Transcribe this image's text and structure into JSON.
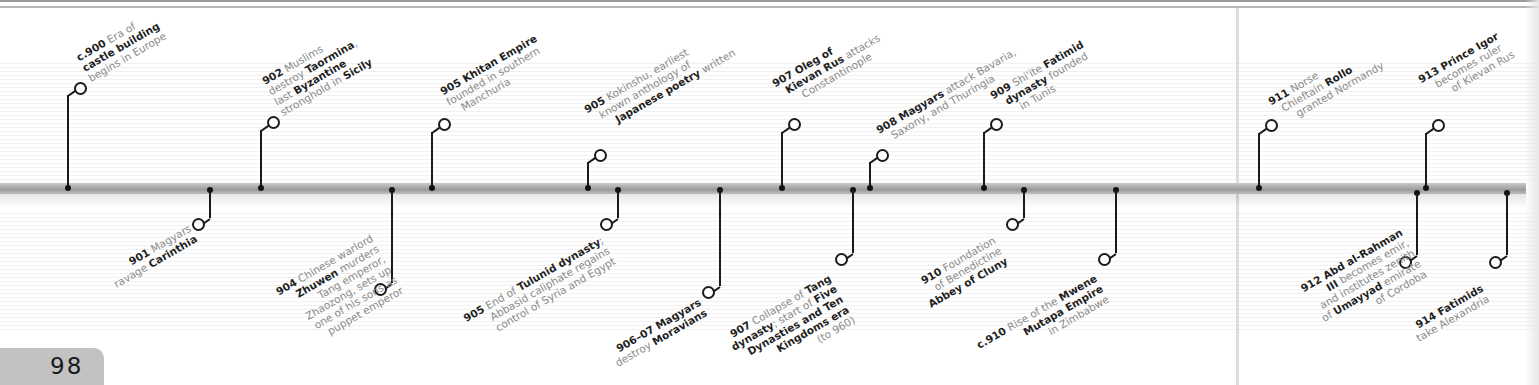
{
  "page": {
    "number": "98",
    "accent_axis": "#a8a8a8",
    "text_color": "#8a8a8a",
    "bold_color": "#1f1f1f"
  },
  "timeline": {
    "above": [
      {
        "id": "e900",
        "x": 68,
        "year": "c.900",
        "lines": [
          [
            "Era of"
          ],
          [
            "castle building"
          ],
          [
            "begins in Europe"
          ]
        ],
        "bold": [
          [
            "castle building"
          ]
        ],
        "text": "c.900 Era of castle building begins in Europe"
      },
      {
        "id": "e902",
        "x": 261,
        "year": "902",
        "text": "902 Muslims destroy Taormina, last Byzantine stronghold in Sicily"
      },
      {
        "id": "e905a",
        "x": 432,
        "year": "905",
        "text": "905 Khitan Empire founded in southern Manchuria"
      },
      {
        "id": "e905b",
        "x": 588,
        "year": "905",
        "text": "905 Kokinshu, earliest known anthology of Japanese poetry written"
      },
      {
        "id": "e907a",
        "x": 782,
        "year": "907",
        "text": "907 Oleg of Kievan Rus attacks Constantinople"
      },
      {
        "id": "e908",
        "x": 870,
        "year": "908",
        "text": "908 Magyars attack Bavaria, Saxony, and Thuringia"
      },
      {
        "id": "e909",
        "x": 984,
        "year": "909",
        "text": "909 Shi'ite Fatimid dynasty founded in Tunis"
      },
      {
        "id": "e911",
        "x": 1259,
        "year": "911",
        "text": "911 Norse Chieftain Rollo granted Normandy"
      },
      {
        "id": "e913",
        "x": 1426,
        "year": "913",
        "text": "913 Prince Igor becomes ruler of Kievan Rus"
      }
    ],
    "below": [
      {
        "id": "e901",
        "x": 210,
        "year": "901",
        "text": "901 Magyars ravage Carinthia"
      },
      {
        "id": "e904",
        "x": 392,
        "year": "904",
        "text": "904 Chinese warlord Zhuwen murders Tang emperor, Zhaozong, sets up one of his sons as puppet emperor"
      },
      {
        "id": "e905c",
        "x": 618,
        "year": "905",
        "text": "905 End of Tulunid dynasty; Abbasid caliphate regains control of Syria and Egypt"
      },
      {
        "id": "e906",
        "x": 720,
        "year": "906–07",
        "text": "906–07 Magyars destroy Moravians"
      },
      {
        "id": "e907b",
        "x": 853,
        "year": "907",
        "text": "907 Collapse of Tang dynasty; start of Five Dynasties and Ten Kingdoms era (to 960)"
      },
      {
        "id": "e910a",
        "x": 1024,
        "year": "910",
        "text": "910 Foundation of Benedictine Abbey of Cluny"
      },
      {
        "id": "e910b",
        "x": 1116,
        "year": "c.910",
        "text": "c.910 Rise of the Mwene Mutapa Empire in Zimbabwe"
      },
      {
        "id": "e912",
        "x": 1417,
        "year": "912",
        "text": "912 Abd al-Rahman III becomes emir, and institutes zenith of Umayyad emirate of Cordoba"
      },
      {
        "id": "e914",
        "x": 1507,
        "year": "914",
        "text": "914 Fatimids take Alexandria"
      }
    ]
  },
  "labels": {
    "e900": {
      "l1_b": "c.900",
      "l1": " Era of",
      "l2_b": "castle building",
      "l3": "begins in Europe"
    },
    "e902": {
      "l1_b": "902",
      "l1": " Muslims",
      "l2": "destroy ",
      "l2_b": "Taormina",
      "l2_e": ",",
      "l3": "last ",
      "l3_b": "Byzantine",
      "l4": "stronghold in ",
      "l4_b": "Sicily"
    },
    "e905a": {
      "l1_b": "905 Khitan Empire",
      "l2": "founded in southern",
      "l3": "Manchuria"
    },
    "e905b": {
      "l1_b": "905",
      "l1": " Kokinshu, earliest",
      "l2": "known anthology of",
      "l3_b": "Japanese poetry",
      "l3": " written"
    },
    "e907a": {
      "l1_b": "907 Oleg of",
      "l2_b": "Kievan Rus",
      "l2": " attacks",
      "l3": "Constantinople"
    },
    "e908": {
      "l1_b": "908 Magyars",
      "l1": " attack Bavaria,",
      "l2": "Saxony, and Thuringia"
    },
    "e909": {
      "l1_b": "909",
      "l1": " Shi'ite ",
      "l1_b2": "Fatimid",
      "l2_b": "dynasty",
      "l2": " founded",
      "l3": "in Tunis"
    },
    "e911": {
      "l1_b": "911",
      "l1": " Norse",
      "l2": "Chieftain ",
      "l2_b": "Rollo",
      "l3": "granted Normandy"
    },
    "e913": {
      "l1_b": "913 Prince Igor",
      "l2": "becomes ruler",
      "l3": "of Kievan Rus"
    },
    "e901": {
      "l1_b": "901",
      "l1": " Magyars",
      "l2": "ravage ",
      "l2_b": "Carinthia"
    },
    "e904": {
      "l1_b": "904",
      "l1": " Chinese warlord",
      "l2_b": "Zhuwen",
      "l2": " murders",
      "l3": "Tang emperor,",
      "l4": "Zhaozong, sets up",
      "l5": "one of his sons as",
      "l6": "puppet emperor"
    },
    "e905c": {
      "l1_b": "905",
      "l1": " End of ",
      "l1_b2": "Tulunid dynasty",
      "l1_e": ";",
      "l2": "Abbasid caliphate regains",
      "l3": "control of Syria and Egypt"
    },
    "e906": {
      "l1_b": "906–07 Magyars",
      "l2": "destroy ",
      "l2_b": "Moravians"
    },
    "e907b": {
      "l1_b": "907",
      "l1": " Collapse of ",
      "l1_b2": "Tang",
      "l2_b": "dynasty",
      "l2": "; start of ",
      "l2_b2": "Five",
      "l3_b": "Dynasties and Ten",
      "l4_b": "Kingdoms era",
      "l5": "(to 960)"
    },
    "e910a": {
      "l1_b": "910",
      "l1": " Foundation",
      "l2": "of Benedictine",
      "l3_b": "Abbey of Cluny"
    },
    "e910b": {
      "l1_b": "c.910",
      "l1": " Rise of the ",
      "l1_b2": "Mwene",
      "l2_b": "Mutapa Empire",
      "l3": "in Zimbabwe"
    },
    "e912": {
      "l1_b": "912 Abd al-Rahman",
      "l2_b": "III",
      "l2": " becomes emir,",
      "l3": "and institutes zenith",
      "l4": "of ",
      "l4_b": "Umayyad",
      "l4_e": " emirate",
      "l5": "of Cordoba"
    },
    "e914": {
      "l1_b": "914 Fatimids",
      "l2": "take Alexandria"
    }
  }
}
